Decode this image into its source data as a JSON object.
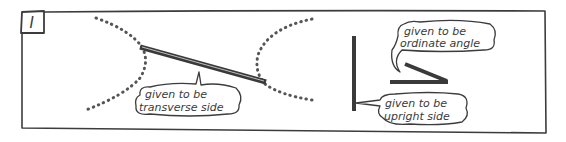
{
  "panel": {
    "label": "I",
    "border_color": "#3c3c3c",
    "background": "#ffffff"
  },
  "figure_left": {
    "description": "two dotted hyperbola branches with a thick segment joining their vertices",
    "branch_left_icon": "dotted-curve",
    "branch_right_icon": "dotted-curve",
    "transverse_line_icon": "thick-line",
    "bubble": {
      "line1": "given to be",
      "line2": "transverse side"
    }
  },
  "figure_right": {
    "upright_line_icon": "thick-vertical-line",
    "angle_icon": "acute-angle",
    "bubble_angle": {
      "line1": "given to be",
      "line2": "ordinate angle"
    },
    "bubble_upright": {
      "line1": "given to be",
      "line2": "upright side"
    }
  }
}
